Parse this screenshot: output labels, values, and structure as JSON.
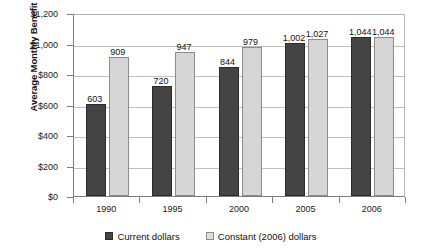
{
  "chart_data": {
    "type": "bar",
    "title": "",
    "xlabel": "",
    "ylabel": "Average Monthly Benefit",
    "categories": [
      "1990",
      "1995",
      "2000",
      "2005",
      "2006"
    ],
    "series": [
      {
        "name": "Current dollars",
        "color": "#444444",
        "values": [
          603,
          720,
          844,
          1002,
          1044
        ],
        "labels": [
          "603",
          "720",
          "844",
          "1,002",
          "1,044"
        ]
      },
      {
        "name": "Constant (2006) dollars",
        "color": "#d6d6d6",
        "values": [
          909,
          947,
          979,
          1027,
          1044
        ],
        "labels": [
          "909",
          "947",
          "979",
          "1,027",
          "1,044"
        ]
      }
    ],
    "ylim": [
      0,
      1200
    ],
    "ytick_values": [
      0,
      200,
      400,
      600,
      800,
      1000,
      1200
    ],
    "ytick_labels": [
      "$0",
      "$200",
      "$400",
      "$600",
      "$800",
      "$1,000",
      "$1,200"
    ],
    "grid": true,
    "legend_position": "bottom"
  },
  "legend": {
    "items": [
      {
        "label": "Current dollars"
      },
      {
        "label": "Constant (2006) dollars"
      }
    ]
  }
}
